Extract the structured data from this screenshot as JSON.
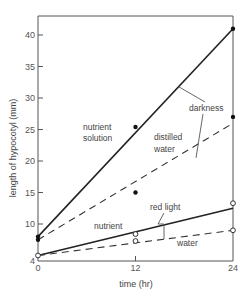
{
  "chart_data": {
    "type": "line",
    "title": "",
    "xlabel": "time (hr)",
    "ylabel": "length of hypocotyl (mm)",
    "xlim": [
      0,
      24
    ],
    "ylim": [
      4,
      43
    ],
    "x_ticks": [
      0,
      12,
      24
    ],
    "y_ticks": [
      4,
      10,
      15,
      20,
      25,
      30,
      35,
      40
    ],
    "grid": false,
    "series": [
      {
        "name": "darkness, nutrient solution",
        "style": "solid",
        "x": [
          0,
          24
        ],
        "y": [
          8,
          41
        ]
      },
      {
        "name": "darkness, distilled water",
        "style": "dashed",
        "x": [
          0,
          24
        ],
        "y": [
          7.5,
          26
        ]
      },
      {
        "name": "red light, nutrient",
        "style": "solid",
        "x": [
          0,
          24
        ],
        "y": [
          5,
          12.5
        ]
      },
      {
        "name": "red light, water",
        "style": "dashed",
        "x": [
          0,
          24
        ],
        "y": [
          5,
          9
        ]
      }
    ],
    "points": [
      {
        "group": "darkness",
        "marker": "filled",
        "x": 0,
        "y": 8
      },
      {
        "group": "darkness",
        "marker": "filled",
        "x": 0,
        "y": 7.5
      },
      {
        "group": "darkness",
        "marker": "filled",
        "x": 12,
        "y": 25.4
      },
      {
        "group": "darkness",
        "marker": "filled",
        "x": 12,
        "y": 15
      },
      {
        "group": "darkness",
        "marker": "filled",
        "x": 24,
        "y": 41
      },
      {
        "group": "darkness",
        "marker": "filled",
        "x": 24,
        "y": 27
      },
      {
        "group": "red light",
        "marker": "open",
        "x": 0,
        "y": 5
      },
      {
        "group": "red light",
        "marker": "open",
        "x": 12,
        "y": 8.4
      },
      {
        "group": "red light",
        "marker": "open",
        "x": 12,
        "y": 7.3
      },
      {
        "group": "red light",
        "marker": "open",
        "x": 24,
        "y": 13.3
      },
      {
        "group": "red light",
        "marker": "open",
        "x": 24,
        "y": 9
      }
    ],
    "annotations": {
      "nutrient_solution": [
        "nutrient",
        "solution"
      ],
      "darkness": "darkness",
      "distilled_water": [
        "distilled",
        "water"
      ],
      "red_light": "red light",
      "nutrient": "nutrient",
      "water": "water"
    }
  }
}
